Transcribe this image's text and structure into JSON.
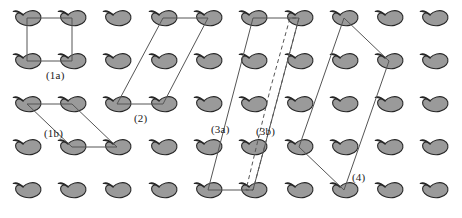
{
  "figure": {
    "background_color": "#ffffff",
    "width": 462,
    "height": 218
  },
  "motif": {
    "name": "comma-motif",
    "fill_color": "#9a9a9a",
    "stroke_color": "#262626",
    "stroke_width": 1.1,
    "width": 30,
    "height": 17,
    "count": 55
  },
  "lattice": {
    "type": "oblique-grid",
    "rows": 5,
    "columns": 11,
    "a_spacing": 45.5,
    "b_spacing": 43,
    "origin_x": 27,
    "origin_y": 18,
    "row_offsets_x": [
      0,
      0,
      0,
      0,
      0
    ],
    "node_positions": [
      {
        "row": 0,
        "y": 18
      },
      {
        "row": 1,
        "y": 61
      },
      {
        "row": 2,
        "y": 104
      },
      {
        "row": 3,
        "y": 147
      },
      {
        "row": 4,
        "y": 190
      }
    ],
    "column_x": [
      27,
      72,
      117,
      163,
      208,
      253,
      299,
      344,
      389,
      434,
      462
    ]
  },
  "unit_cells": [
    {
      "id": "1a",
      "label": "(1a)",
      "style": "solid",
      "stroke_color": "#555555",
      "stroke_width": 1,
      "shape": "rectangle",
      "points": "27,18 72,18 72,61 27,61",
      "label_x": 46,
      "label_y": 70
    },
    {
      "id": "1b",
      "label": "(1b)",
      "style": "solid",
      "stroke_color": "#555555",
      "stroke_width": 1,
      "shape": "parallelogram",
      "points": "27,104 72,104 117,147 72,147",
      "label_x": 44,
      "label_y": 128
    },
    {
      "id": "2",
      "label": "(2)",
      "style": "solid",
      "stroke_color": "#555555",
      "stroke_width": 1,
      "shape": "parallelogram",
      "points": "163,18 208,18 163,104 117,104",
      "label_x": 134,
      "label_y": 113
    },
    {
      "id": "3a",
      "label": "(3a)",
      "style": "solid",
      "stroke_color": "#555555",
      "stroke_width": 1,
      "shape": "parallelogram",
      "points": "253,18 208,190 253,190 299,18",
      "label_x": 211,
      "label_y": 124
    },
    {
      "id": "3b",
      "label": "(3b)",
      "style": "dashed",
      "stroke_color": "#555555",
      "stroke_width": 1,
      "dash_pattern": "4,3",
      "shape": "parallelogram",
      "points": "270,90 290,18 299,18 253,190 246,190",
      "label_x": 256,
      "label_y": 126
    },
    {
      "id": "4",
      "label": "(4)",
      "style": "solid",
      "stroke_color": "#555555",
      "stroke_width": 1,
      "shape": "parallelogram",
      "points": "344,18 389,61 344,190 299,147",
      "label_x": 352,
      "label_y": 172
    }
  ],
  "colors": {
    "motif_fill": "#9a9a9a",
    "motif_outline": "#262626",
    "cell_line": "#555555",
    "label_text": "#1a1a1a",
    "page_background": "#ffffff"
  }
}
